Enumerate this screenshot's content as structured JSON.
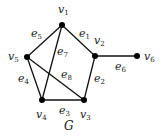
{
  "diagram": {
    "title": "G",
    "title_pos": [
      64,
      130
    ],
    "edge_color": "#111111",
    "node_color": "#000000",
    "nodes": [
      {
        "id": "v1",
        "label": "v",
        "sub": "1",
        "x": 62,
        "y": 25,
        "lx": 58,
        "ly": 13
      },
      {
        "id": "v2",
        "label": "v",
        "sub": "2",
        "x": 95,
        "y": 56,
        "lx": 94,
        "ly": 44
      },
      {
        "id": "v3",
        "label": "v",
        "sub": "3",
        "x": 84,
        "y": 100,
        "lx": 80,
        "ly": 118
      },
      {
        "id": "v4",
        "label": "v",
        "sub": "4",
        "x": 42,
        "y": 100,
        "lx": 36,
        "ly": 118
      },
      {
        "id": "v5",
        "label": "v",
        "sub": "5",
        "x": 27,
        "y": 57,
        "lx": 8,
        "ly": 60
      },
      {
        "id": "v6",
        "label": "v",
        "sub": "6",
        "x": 137,
        "y": 56,
        "lx": 144,
        "ly": 60
      }
    ],
    "edges": [
      {
        "id": "e1",
        "label": "e",
        "sub": "1",
        "from": "v1",
        "to": "v2",
        "lx": 79,
        "ly": 37
      },
      {
        "id": "e2",
        "label": "e",
        "sub": "2",
        "from": "v2",
        "to": "v3",
        "lx": 94,
        "ly": 82
      },
      {
        "id": "e3",
        "label": "e",
        "sub": "3",
        "from": "v4",
        "to": "v3",
        "lx": 59,
        "ly": 114
      },
      {
        "id": "e4",
        "label": "e",
        "sub": "4",
        "from": "v5",
        "to": "v4",
        "lx": 18,
        "ly": 82
      },
      {
        "id": "e5",
        "label": "e",
        "sub": "5",
        "from": "v1",
        "to": "v5",
        "lx": 31,
        "ly": 37
      },
      {
        "id": "e6",
        "label": "e",
        "sub": "6",
        "from": "v2",
        "to": "v6",
        "lx": 115,
        "ly": 70
      },
      {
        "id": "e7",
        "label": "e",
        "sub": "7",
        "from": "v1",
        "to": "v4",
        "lx": 57,
        "ly": 55
      },
      {
        "id": "e8",
        "label": "e",
        "sub": "8",
        "from": "v5",
        "to": "v3",
        "lx": 61,
        "ly": 78
      }
    ]
  }
}
